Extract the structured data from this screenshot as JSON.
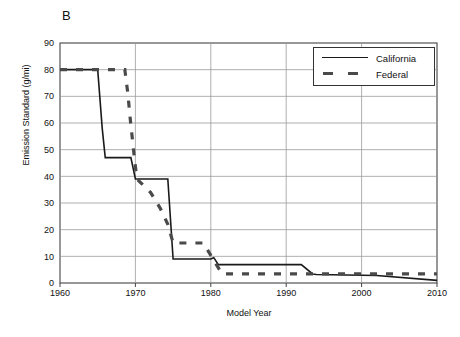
{
  "figure": {
    "panel_label": "B",
    "background": "#ffffff",
    "line_color": "#1a1a1a",
    "grid_color": "#9a9a9a",
    "axis_color": "#444444"
  },
  "legend": {
    "position": "top-right",
    "entries": [
      {
        "label": "California",
        "style": "solid",
        "color": "#1a1a1a"
      },
      {
        "label": "Federal",
        "style": "dashed",
        "color": "#4a4a4a"
      }
    ]
  },
  "chart_data": {
    "type": "line",
    "title": "B",
    "xlabel": "Model Year",
    "ylabel": "Emission Standard (g/mi)",
    "xlim": [
      1960,
      2010
    ],
    "ylim": [
      0,
      90
    ],
    "xticks": [
      1960,
      1970,
      1980,
      1990,
      2000,
      2010
    ],
    "yticks": [
      0,
      10,
      20,
      30,
      40,
      50,
      60,
      70,
      80,
      90
    ],
    "grid": "horizontal",
    "series": [
      {
        "name": "California",
        "style": "solid",
        "x": [
          1960,
          1965,
          1965.6,
          1966,
          1969.4,
          1970,
          1974.3,
          1975,
          1980,
          1980.4,
          1981,
          1992,
          1993.5,
          1994,
          2002,
          2010
        ],
        "y": [
          80,
          80,
          58,
          47,
          47,
          39,
          39,
          9,
          9,
          9.5,
          6.9,
          6.9,
          3.4,
          3.2,
          2.8,
          1.0
        ]
      },
      {
        "name": "Federal",
        "style": "dashed",
        "x": [
          1960,
          1968.6,
          1969.0,
          1969.3,
          1969.6,
          1969.9,
          1970.2,
          1972,
          1973.3,
          1974.3,
          1975,
          1979,
          1981.5,
          2010
        ],
        "y": [
          80,
          80,
          71,
          62,
          54,
          46,
          39,
          34,
          28,
          22,
          15,
          15,
          3.4,
          3.4
        ]
      }
    ],
    "series_points": {
      "California": [
        {
          "year": 1960,
          "value": 80
        },
        {
          "year": 1965,
          "value": 80
        },
        {
          "year": 1966,
          "value": 47
        },
        {
          "year": 1970,
          "value": 39
        },
        {
          "year": 1974,
          "value": 39
        },
        {
          "year": 1975,
          "value": 9
        },
        {
          "year": 1980,
          "value": 9
        },
        {
          "year": 1981,
          "value": 6.9
        },
        {
          "year": 1992,
          "value": 6.9
        },
        {
          "year": 1994,
          "value": 3.2
        },
        {
          "year": 2002,
          "value": 2.8
        },
        {
          "year": 2010,
          "value": 1.0
        }
      ],
      "Federal": [
        {
          "year": 1960,
          "value": 80
        },
        {
          "year": 1968,
          "value": 80
        },
        {
          "year": 1969,
          "value": 71
        },
        {
          "year": 1969.3,
          "value": 62
        },
        {
          "year": 1969.6,
          "value": 54
        },
        {
          "year": 1969.9,
          "value": 46
        },
        {
          "year": 1970,
          "value": 39
        },
        {
          "year": 1972,
          "value": 34
        },
        {
          "year": 1973,
          "value": 28
        },
        {
          "year": 1974,
          "value": 22
        },
        {
          "year": 1975,
          "value": 15
        },
        {
          "year": 1979,
          "value": 15
        },
        {
          "year": 1981,
          "value": 3.4
        },
        {
          "year": 2010,
          "value": 3.4
        }
      ]
    }
  }
}
